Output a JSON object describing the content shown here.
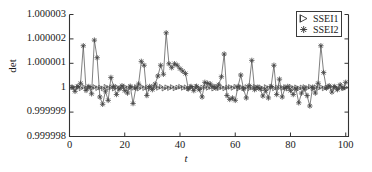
{
  "chart_data": {
    "type": "line",
    "title": "",
    "xlabel": "t",
    "ylabel": "det",
    "xlim": [
      0,
      101
    ],
    "ylim": [
      0.999998,
      1.000003
    ],
    "xticks": [
      0,
      20,
      40,
      60,
      80,
      100
    ],
    "xtick_labels": [
      "0",
      "20",
      "40",
      "60",
      "80",
      "100"
    ],
    "yticks": [
      0.999998,
      0.999999,
      1.0,
      1.000001,
      1.000002,
      1.000003
    ],
    "ytick_labels": [
      "0.999998",
      "0.999999",
      "1",
      "1.000001",
      "1.000002",
      "1.000003"
    ],
    "grid": false,
    "legend_position": "top-right",
    "line_color": "#555555",
    "marker_color": "#444444",
    "axis_color": "#333333",
    "background": "#ffffff",
    "series": [
      {
        "name": "SSEI1",
        "marker": "triangle-right",
        "x": [
          1,
          2,
          3,
          4,
          5,
          6,
          7,
          8,
          9,
          10,
          11,
          12,
          13,
          14,
          15,
          16,
          17,
          18,
          19,
          20,
          21,
          22,
          23,
          24,
          25,
          26,
          27,
          28,
          29,
          30,
          31,
          32,
          33,
          34,
          35,
          36,
          37,
          38,
          39,
          40,
          41,
          42,
          43,
          44,
          45,
          46,
          47,
          48,
          49,
          50,
          51,
          52,
          53,
          54,
          55,
          56,
          57,
          58,
          59,
          60,
          61,
          62,
          63,
          64,
          65,
          66,
          67,
          68,
          69,
          70,
          71,
          72,
          73,
          74,
          75,
          76,
          77,
          78,
          79,
          80,
          81,
          82,
          83,
          84,
          85,
          86,
          87,
          88,
          89,
          90,
          91,
          92,
          93,
          94,
          95,
          96,
          97,
          98,
          99,
          100
        ],
        "y": [
          1.00000002,
          0.99999998,
          1.00000003,
          0.99999997,
          1.00000004,
          0.99999996,
          1.00000002,
          0.99999999,
          1.00000003,
          0.99999998,
          1.00000001,
          0.99999997,
          1.00000004,
          0.99999999,
          1.00000002,
          0.99999996,
          1.00000003,
          0.99999998,
          1.00000001,
          1.00000004,
          0.99999997,
          1.00000002,
          0.99999999,
          1.00000003,
          0.99999996,
          1.00000004,
          0.99999998,
          1.00000001,
          0.99999997,
          1.00000003,
          1.00000002,
          0.99999999,
          1.00000004,
          0.99999996,
          1.00000002,
          0.99999998,
          1.00000003,
          0.99999997,
          1.00000001,
          1.00000004,
          0.99999999,
          1.00000002,
          0.99999996,
          1.00000003,
          0.99999998,
          1.00000004,
          0.99999997,
          1.00000001,
          1.00000002,
          0.99999999,
          1.00000003,
          0.99999996,
          1.00000004,
          0.99999998,
          1.00000002,
          0.99999997,
          1.00000001,
          1.00000003,
          0.99999999,
          1.00000004,
          0.99999996,
          1.00000002,
          0.99999998,
          1.00000003,
          0.99999997,
          1.00000001,
          1.00000004,
          0.99999999,
          1.00000002,
          0.99999996,
          1.00000003,
          0.99999998,
          1.00000004,
          0.99999997,
          1.00000001,
          1.00000002,
          0.99999999,
          1.00000003,
          0.99999996,
          1.00000004,
          0.99999998,
          1.00000002,
          0.99999997,
          1.00000001,
          1.00000003,
          0.99999999,
          1.00000004,
          0.99999996,
          1.00000002,
          0.99999998,
          1.00000003,
          0.99999997,
          1.00000001,
          1.00000004,
          0.99999999,
          1.00000002,
          0.99999996,
          1.00000003,
          0.99999998,
          1.00000001
        ]
      },
      {
        "name": "SSEI2",
        "marker": "asterisk",
        "x": [
          1,
          2,
          3,
          4,
          5,
          6,
          7,
          8,
          9,
          10,
          11,
          12,
          13,
          14,
          15,
          16,
          17,
          18,
          19,
          20,
          21,
          22,
          23,
          24,
          25,
          26,
          27,
          28,
          29,
          30,
          31,
          32,
          33,
          34,
          35,
          36,
          37,
          38,
          39,
          40,
          41,
          42,
          43,
          44,
          45,
          46,
          47,
          48,
          49,
          50,
          51,
          52,
          53,
          54,
          55,
          56,
          57,
          58,
          59,
          60,
          61,
          62,
          63,
          64,
          65,
          66,
          67,
          68,
          69,
          70,
          71,
          72,
          73,
          74,
          75,
          76,
          77,
          78,
          79,
          80,
          81,
          82,
          83,
          84,
          85,
          86,
          87,
          88,
          89,
          90,
          91,
          92,
          93,
          94,
          95,
          96,
          97,
          98,
          99,
          100
        ],
        "y": [
          1.00000002,
          0.99999985,
          1.00000005,
          1.00000018,
          1.00000172,
          0.99999989,
          1.00000005,
          0.99999975,
          1.00000195,
          1.00000123,
          0.99999962,
          0.99999932,
          0.99999986,
          0.99999948,
          1.00000042,
          1.00000005,
          0.99999972,
          0.99999995,
          1.00000008,
          0.99999988,
          0.99999978,
          1.00000006,
          0.99999935,
          0.99999998,
          1.00000015,
          1.00000108,
          1.00000092,
          0.99999968,
          1.00000005,
          0.99999992,
          1.00000015,
          1.00000048,
          1.00000092,
          1.00000055,
          1.00000225,
          1.00000098,
          1.00000082,
          1.00000098,
          1.00000092,
          1.00000078,
          1.00000068,
          1.00000058,
          0.99999995,
          1.00000005,
          0.99999988,
          1.00000006,
          0.99999992,
          0.99999962,
          1.00000022,
          1.00000018,
          1.00000015,
          1.00000005,
          0.99999998,
          1.00000012,
          1.00000045,
          1.00000138,
          0.99999968,
          0.99999952,
          0.99999958,
          0.99999948,
          1.00000005,
          1.00000052,
          0.99999995,
          0.99999958,
          1.00000008,
          1.00000112,
          0.99999992,
          1.00000002,
          0.99999995,
          0.99999966,
          0.99999988,
          0.99999958,
          1.00000005,
          1.00000092,
          0.99999972,
          1.00000035,
          0.99999962,
          0.99999998,
          1.00000005,
          0.99999988,
          0.99999972,
          0.99999995,
          0.99999938,
          0.99999978,
          0.99999995,
          0.99999968,
          0.99999925,
          1.00000002,
          0.99999978,
          1.00000018,
          1.00000172,
          1.00000062,
          0.99999998,
          1.00000008,
          0.99999982,
          1.00000005,
          0.99999992,
          1.00000012,
          0.99999998,
          1.00000022
        ]
      }
    ]
  }
}
